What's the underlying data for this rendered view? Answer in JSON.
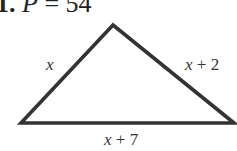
{
  "problem": {
    "number": "1.",
    "variable": "P",
    "equals": " = ",
    "value": "54"
  },
  "figure": {
    "shape": "triangle",
    "stroke_color": "#333333",
    "vertices": {
      "apex": [
        113,
        25
      ],
      "bottom_left": [
        21,
        123
      ],
      "bottom_right": [
        234,
        123
      ]
    },
    "sides": {
      "left": {
        "var": "x",
        "rest": ""
      },
      "right": {
        "var": "x",
        "rest": " + 2"
      },
      "bottom": {
        "var": "x",
        "rest": " + 7"
      }
    }
  }
}
